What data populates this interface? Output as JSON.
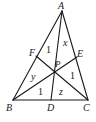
{
  "diagram": {
    "type": "triangle-cevians",
    "stroke_color": "#1a1a1a",
    "points": {
      "A": {
        "label": "A",
        "x": 62,
        "y": 11
      },
      "B": {
        "label": "B",
        "x": 13,
        "y": 100
      },
      "C": {
        "label": "C",
        "x": 88,
        "y": 100
      },
      "D": {
        "label": "D",
        "x": 51,
        "y": 100
      },
      "E": {
        "label": "E",
        "x": 77,
        "y": 57
      },
      "F": {
        "label": "F",
        "x": 36,
        "y": 56
      },
      "P": {
        "label": "P",
        "x": 54,
        "y": 71
      }
    },
    "segments": [
      [
        "A",
        "B"
      ],
      [
        "B",
        "C"
      ],
      [
        "C",
        "A"
      ],
      [
        "A",
        "D"
      ],
      [
        "B",
        "E"
      ],
      [
        "C",
        "F"
      ]
    ],
    "region_labels": {
      "AFP": "1",
      "APE": "x",
      "BFP": "y",
      "BPD": "1",
      "DPC": "z",
      "CPE": "1"
    }
  }
}
